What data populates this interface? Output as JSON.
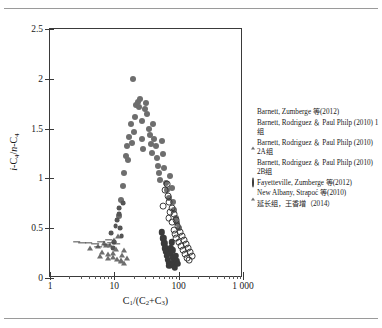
{
  "figure": {
    "x_axis_title": "C1/(C2+C3)",
    "y_axis_title": "i-C4/n-C4"
  },
  "chart_data": {
    "type": "scatter",
    "title": "",
    "xlabel": "C1/(C2+C3)",
    "ylabel": "i-C4/n-C4",
    "xscale": "log",
    "yscale": "linear",
    "xlim": [
      1,
      1000
    ],
    "ylim": [
      0,
      2.5
    ],
    "xticks": [
      1,
      10,
      100,
      1000
    ],
    "xtick_labels": [
      "1",
      "10",
      "100",
      "1 000"
    ],
    "yticks": [
      0,
      0.5,
      1,
      1.5,
      2,
      2.5
    ],
    "ytick_labels": [
      "0",
      "0.5",
      "1",
      "1.5",
      "2",
      "2.5"
    ],
    "grid": false,
    "legend_position": "right",
    "series": [
      {
        "name": "Barnett, Zumberge 等(2012)",
        "marker": "filled-circle",
        "color": "#6e6e6e",
        "size": 3.0,
        "points": [
          [
            12.0,
            0.62
          ],
          [
            12.8,
            0.78
          ],
          [
            13.5,
            0.92
          ],
          [
            14.2,
            1.05
          ],
          [
            15.0,
            1.22
          ],
          [
            15.8,
            1.33
          ],
          [
            16.5,
            1.18
          ],
          [
            17.2,
            1.42
          ],
          [
            18.0,
            1.55
          ],
          [
            18.6,
            1.36
          ],
          [
            19.5,
            2.0
          ],
          [
            20.5,
            1.47
          ],
          [
            21.0,
            1.62
          ],
          [
            22.0,
            1.74
          ],
          [
            23.0,
            1.77
          ],
          [
            24.0,
            1.72
          ],
          [
            25.0,
            1.8
          ],
          [
            26.5,
            1.58
          ],
          [
            27.0,
            1.4
          ],
          [
            28.0,
            1.3
          ],
          [
            29.5,
            1.7
          ],
          [
            31.0,
            1.76
          ],
          [
            32.5,
            1.65
          ],
          [
            34.0,
            1.5
          ],
          [
            35.5,
            1.44
          ],
          [
            37.0,
            1.35
          ],
          [
            38.5,
            1.26
          ],
          [
            40.0,
            1.55
          ],
          [
            42.0,
            1.4
          ],
          [
            44.0,
            1.33
          ],
          [
            46.0,
            1.2
          ],
          [
            48.0,
            1.12
          ],
          [
            50.0,
            1.05
          ],
          [
            52.0,
            0.98
          ],
          [
            55.0,
            1.38
          ],
          [
            58.0,
            1.25
          ],
          [
            60.0,
            1.1
          ],
          [
            63.0,
            0.95
          ],
          [
            66.0,
            0.88
          ],
          [
            70.0,
            0.8
          ],
          [
            74.0,
            1.02
          ],
          [
            78.0,
            0.9
          ],
          [
            82.0,
            0.76
          ],
          [
            86.0,
            0.68
          ],
          [
            90.0,
            0.6
          ],
          [
            95.0,
            0.55
          ],
          [
            100.0,
            0.5
          ]
        ]
      },
      {
        "name": "Barnett, Rodriguez & Paul Philp (2010) 1组",
        "marker": "filled-square-dark",
        "color": "#3a3a3a",
        "size": 3.2,
        "points": [
          [
            55.0,
            0.46
          ],
          [
            58.0,
            0.4
          ],
          [
            60.0,
            0.35
          ],
          [
            62.0,
            0.3
          ],
          [
            64.0,
            0.26
          ],
          [
            66.0,
            0.22
          ],
          [
            68.0,
            0.18
          ],
          [
            70.0,
            0.15
          ],
          [
            72.0,
            0.12
          ],
          [
            74.0,
            0.24
          ],
          [
            76.0,
            0.3
          ],
          [
            78.0,
            0.36
          ],
          [
            80.0,
            0.28
          ],
          [
            82.0,
            0.2
          ],
          [
            84.0,
            0.16
          ],
          [
            86.0,
            0.13
          ],
          [
            88.0,
            0.1
          ],
          [
            90.0,
            0.22
          ],
          [
            93.0,
            0.17
          ],
          [
            96.0,
            0.14
          ]
        ]
      },
      {
        "name": "Barnett, Rodriguez & Paul Philp (2010) 2A组",
        "marker": "filled-triangle",
        "color": "#6e6e6e",
        "size": 3.2,
        "points": [
          [
            4.2,
            0.3
          ],
          [
            5.5,
            0.32
          ],
          [
            7.0,
            0.35
          ],
          [
            8.5,
            0.33
          ],
          [
            10.0,
            0.38
          ],
          [
            11.5,
            0.42
          ],
          [
            6.0,
            0.22
          ],
          [
            8.0,
            0.2
          ],
          [
            9.5,
            0.25
          ],
          [
            12.5,
            0.18
          ],
          [
            14.0,
            0.28
          ]
        ]
      },
      {
        "name": "Barnett, Rodriguez & Paul Philp (2010) 2B组",
        "marker": "small-filled-circle",
        "color": "#555555",
        "size": 2.4,
        "points": [
          [
            9.0,
            0.45
          ],
          [
            10.5,
            0.52
          ],
          [
            11.0,
            0.58
          ],
          [
            11.8,
            0.64
          ],
          [
            12.4,
            0.5
          ],
          [
            13.0,
            0.42
          ],
          [
            10.0,
            0.36
          ],
          [
            9.5,
            0.3
          ],
          [
            12.0,
            0.7
          ],
          [
            13.6,
            0.75
          ]
        ]
      },
      {
        "name": "Fayetteville, Zumberge 等(2012)",
        "marker": "open-circle",
        "color": "#3a3a3a",
        "size": 3.4,
        "points": [
          [
            62.0,
            0.88
          ],
          [
            68.0,
            0.82
          ],
          [
            72.0,
            0.76
          ],
          [
            78.0,
            0.7
          ],
          [
            84.0,
            0.64
          ],
          [
            90.0,
            0.58
          ],
          [
            96.0,
            0.52
          ],
          [
            104.0,
            0.46
          ],
          [
            112.0,
            0.42
          ],
          [
            120.0,
            0.38
          ],
          [
            130.0,
            0.34
          ],
          [
            140.0,
            0.3
          ],
          [
            150.0,
            0.26
          ],
          [
            160.0,
            0.22
          ],
          [
            66.0,
            0.94
          ],
          [
            74.0,
            0.66
          ],
          [
            86.0,
            0.48
          ],
          [
            100.0,
            0.36
          ],
          [
            118.0,
            0.28
          ],
          [
            135.0,
            0.2
          ],
          [
            58.0,
            0.72
          ],
          [
            80.0,
            0.56
          ],
          [
            92.0,
            0.4
          ],
          [
            108.0,
            0.32
          ],
          [
            125.0,
            0.24
          ],
          [
            145.0,
            0.18
          ],
          [
            70.0,
            0.6
          ],
          [
            88.0,
            0.44
          ]
        ]
      },
      {
        "name": "New Albany, Strapoć 等(2010)",
        "marker": "filled-triangle",
        "color": "#6e6e6e",
        "size": 3.2,
        "points": [
          [
            6.5,
            0.26
          ],
          [
            8.0,
            0.24
          ],
          [
            9.5,
            0.21
          ],
          [
            11.0,
            0.19
          ],
          [
            12.5,
            0.17
          ],
          [
            14.0,
            0.15
          ],
          [
            7.5,
            0.33
          ],
          [
            10.5,
            0.29
          ],
          [
            13.0,
            0.23
          ],
          [
            16.0,
            0.2
          ]
        ]
      },
      {
        "name": "延长组，王香增（2014）",
        "marker": "dash",
        "color": "#4a4a4a",
        "size": 4.5,
        "points": [
          [
            3.2,
            0.35
          ],
          [
            4.0,
            0.35
          ],
          [
            5.0,
            0.34
          ],
          [
            6.2,
            0.36
          ],
          [
            7.6,
            0.33
          ],
          [
            9.0,
            0.35
          ],
          [
            10.8,
            0.34
          ],
          [
            2.6,
            0.36
          ],
          [
            5.6,
            0.31
          ],
          [
            8.2,
            0.38
          ]
        ]
      }
    ]
  },
  "legend": {
    "items": [
      {
        "label": "Barnett, Zumberge 等(2012)",
        "marker": "filled-circle"
      },
      {
        "label": "Barnett, Rodriguez ＆ Paul Philp (2010) 1组",
        "marker": "filled-square-dark"
      },
      {
        "label": "Barnett, Rodriguez ＆ Paul Philp (2010) 2A组",
        "marker": "filled-triangle"
      },
      {
        "label": "Barnett, Rodriguez ＆ Paul Philp (2010) 2B组",
        "marker": "small-filled-circle"
      },
      {
        "label": "Fayetteville, Zumberge 等(2012)",
        "marker": "open-circle"
      },
      {
        "label": "New Albany, Strapoć 等(2010)",
        "marker": "filled-triangle"
      },
      {
        "label": "延长组，王香增（2014）",
        "marker": "dash"
      }
    ]
  }
}
